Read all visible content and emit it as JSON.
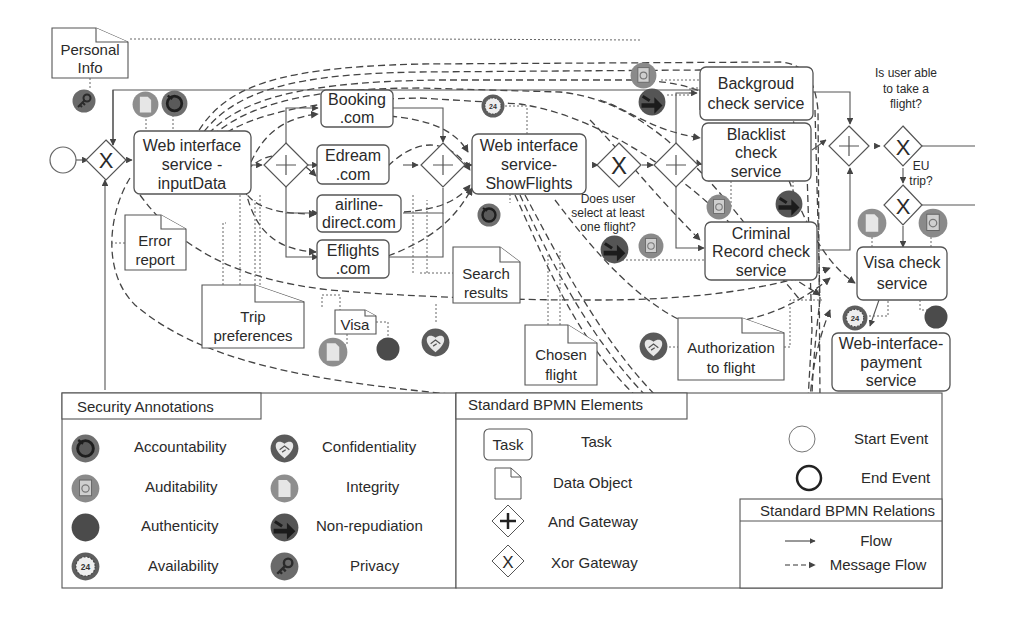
{
  "diagram": {
    "start_event": {
      "label": ""
    },
    "tasks": [
      {
        "id": "t_input",
        "lines": [
          "Web interface",
          "service -",
          "inputData"
        ]
      },
      {
        "id": "t_booking",
        "lines": [
          "Booking",
          ".com"
        ]
      },
      {
        "id": "t_edream",
        "lines": [
          "Edream",
          ".com"
        ]
      },
      {
        "id": "t_airline",
        "lines": [
          "airline-",
          "direct.com"
        ]
      },
      {
        "id": "t_eflights",
        "lines": [
          "Eflights",
          ".com"
        ]
      },
      {
        "id": "t_show",
        "lines": [
          "Web interface",
          "service-",
          "ShowFlights"
        ]
      },
      {
        "id": "t_background",
        "lines": [
          "Backgroud",
          "check service"
        ]
      },
      {
        "id": "t_blacklist",
        "lines": [
          "Blacklist",
          "check",
          "service"
        ]
      },
      {
        "id": "t_criminal",
        "lines": [
          "Criminal",
          "Record check",
          "service"
        ]
      },
      {
        "id": "t_visa",
        "lines": [
          "Visa check",
          "service"
        ]
      },
      {
        "id": "t_payment",
        "lines": [
          "Web-interface-",
          "payment",
          "service"
        ]
      }
    ],
    "data_objects": [
      {
        "id": "d_personal",
        "lines": [
          "Personal",
          "Info"
        ]
      },
      {
        "id": "d_error",
        "lines": [
          "Error",
          "report"
        ]
      },
      {
        "id": "d_trip",
        "lines": [
          "Trip",
          "preferences"
        ]
      },
      {
        "id": "d_visa",
        "lines": [
          "Visa"
        ]
      },
      {
        "id": "d_search",
        "lines": [
          "Search",
          "results"
        ]
      },
      {
        "id": "d_chosen",
        "lines": [
          "Chosen",
          "flight"
        ]
      },
      {
        "id": "d_auth",
        "lines": [
          "Authorization",
          "to flight"
        ]
      }
    ],
    "gateway_questions": {
      "select_flight": [
        "Does user",
        "select at least",
        "one flight?"
      ],
      "able_to_fly": [
        "Is user able",
        "to take a",
        "flight?"
      ],
      "eu_trip": [
        "EU",
        "trip?"
      ]
    },
    "security_badges": [
      {
        "type": "privacy",
        "near": "Personal Info"
      },
      {
        "type": "integrity",
        "near": "Web interface service - inputData"
      },
      {
        "type": "accountability",
        "near": "Web interface service - inputData"
      },
      {
        "type": "availability",
        "near": "Web interface service-ShowFlights"
      },
      {
        "type": "accountability",
        "near": "Web interface service-ShowFlights"
      },
      {
        "type": "auditability",
        "near": "Backgroud check service"
      },
      {
        "type": "non-repudiation",
        "near": "Backgroud check service"
      },
      {
        "type": "auditability",
        "near": "Blacklist check service"
      },
      {
        "type": "non-repudiation",
        "near": "Blacklist check service"
      },
      {
        "type": "non-repudiation",
        "near": "Criminal Record check service"
      },
      {
        "type": "auditability",
        "near": "Criminal Record check service"
      },
      {
        "type": "integrity",
        "near": "Visa"
      },
      {
        "type": "authenticity",
        "near": "Visa"
      },
      {
        "type": "confidentiality",
        "near": "Search results"
      },
      {
        "type": "confidentiality",
        "near": "Authorization to flight"
      },
      {
        "type": "integrity",
        "near": "Visa check service"
      },
      {
        "type": "auditability",
        "near": "Visa check service"
      },
      {
        "type": "availability",
        "near": "Visa check service"
      },
      {
        "type": "authenticity",
        "near": "Visa check service"
      }
    ]
  },
  "legend": {
    "security": {
      "title": "Security Annotations",
      "items": [
        {
          "icon": "accountability",
          "label": "Accountability"
        },
        {
          "icon": "auditability",
          "label": "Auditability"
        },
        {
          "icon": "authenticity",
          "label": "Authenticity"
        },
        {
          "icon": "availability",
          "label": "Availability"
        },
        {
          "icon": "confidentiality",
          "label": "Confidentiality"
        },
        {
          "icon": "integrity",
          "label": "Integrity"
        },
        {
          "icon": "non-repudiation",
          "label": "Non-repudiation"
        },
        {
          "icon": "privacy",
          "label": "Privacy"
        }
      ]
    },
    "elements": {
      "title": "Standard BPMN Elements",
      "task_symbol_label": "Task",
      "items": [
        {
          "symbol": "task",
          "label": "Task"
        },
        {
          "symbol": "data-object",
          "label": "Data Object"
        },
        {
          "symbol": "and-gateway",
          "label": "And Gateway"
        },
        {
          "symbol": "xor-gateway",
          "label": "Xor Gateway"
        },
        {
          "symbol": "start-event",
          "label": "Start Event"
        },
        {
          "symbol": "end-event",
          "label": "End Event"
        }
      ]
    },
    "relations": {
      "title": "Standard BPMN Relations",
      "items": [
        {
          "symbol": "flow",
          "label": "Flow"
        },
        {
          "symbol": "message-flow",
          "label": "Message Flow"
        }
      ]
    }
  },
  "colors": {
    "badge_dark": "#4a4a4a",
    "badge_mid": "#7a7a7a",
    "badge_light": "#b5b5b5",
    "stroke": "#555555"
  }
}
